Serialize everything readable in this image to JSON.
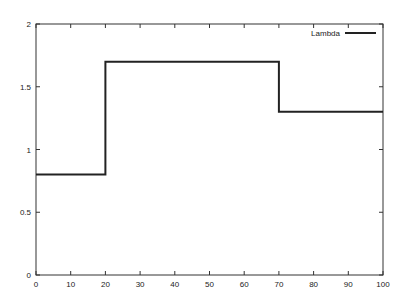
{
  "chart_data": {
    "type": "line",
    "title": "",
    "xlabel": "",
    "ylabel": "",
    "xlim": [
      0,
      100
    ],
    "ylim": [
      0,
      2
    ],
    "grid": false,
    "legend_position": "top-right",
    "x_ticks": [
      0,
      10,
      20,
      30,
      40,
      50,
      60,
      70,
      80,
      90,
      100
    ],
    "y_ticks": [
      0,
      0.5,
      1,
      1.5,
      2
    ],
    "y_tick_labels": [
      "0",
      "0.5",
      "1",
      "1.5",
      "2"
    ],
    "series": [
      {
        "name": "Lambda",
        "color": "#222222",
        "style": "step",
        "x": [
          0,
          20,
          20,
          70,
          70,
          100
        ],
        "y": [
          0.8,
          0.8,
          1.7,
          1.7,
          1.3,
          1.3
        ]
      }
    ]
  }
}
